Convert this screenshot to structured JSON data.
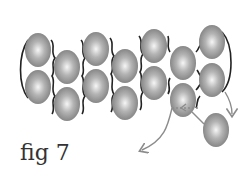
{
  "figure": {
    "caption": "fig 7",
    "bead_color_center": "#f4f4f4",
    "bead_color_edge": "#8a8a8a",
    "thread_color": "#222222",
    "path_color": "#8c8c8c",
    "beads": [
      {
        "cx": 38,
        "cy": 50
      },
      {
        "cx": 38,
        "cy": 87
      },
      {
        "cx": 67,
        "cy": 67
      },
      {
        "cx": 67,
        "cy": 104
      },
      {
        "cx": 96,
        "cy": 49
      },
      {
        "cx": 96,
        "cy": 86
      },
      {
        "cx": 125,
        "cy": 66
      },
      {
        "cx": 125,
        "cy": 103
      },
      {
        "cx": 154,
        "cy": 46
      },
      {
        "cx": 154,
        "cy": 83
      },
      {
        "cx": 183,
        "cy": 63
      },
      {
        "cx": 183,
        "cy": 100
      },
      {
        "cx": 212,
        "cy": 42
      },
      {
        "cx": 212,
        "cy": 80
      },
      {
        "cx": 216,
        "cy": 130
      }
    ]
  }
}
